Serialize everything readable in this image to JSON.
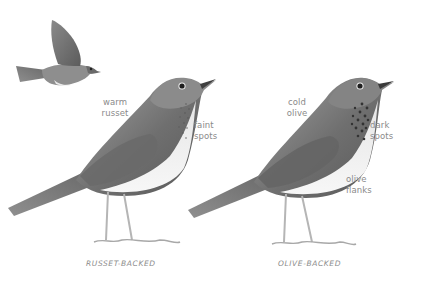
{
  "figure": {
    "type": "field-guide comparison illustration",
    "birds": [
      {
        "id": "russet-backed",
        "caption": "RUSSET-BACKED",
        "notes": [
          {
            "id": "back",
            "text_line1": "warm",
            "text_line2": "russet"
          },
          {
            "id": "breast",
            "text_line1": "faint",
            "text_line2": "spots"
          }
        ]
      },
      {
        "id": "olive-backed",
        "caption": "OLIVE-BACKED",
        "notes": [
          {
            "id": "back",
            "text_line1": "cold",
            "text_line2": "olive"
          },
          {
            "id": "breast",
            "text_line1": "dark",
            "text_line2": "spots"
          },
          {
            "id": "flanks",
            "text_line1": "olive",
            "text_line2": "flanks"
          }
        ]
      }
    ],
    "extra": {
      "flying_bird": "russet-backed in flight"
    }
  },
  "colors": {
    "background": "#ffffff",
    "plumage_dark": "#5e5e5e",
    "plumage_mid": "#8d8d8d",
    "plumage_light": "#c9c9c9",
    "belly": "#f1f1f1",
    "legs": "#b5b5b5",
    "label_text": "#8a8a8a"
  }
}
